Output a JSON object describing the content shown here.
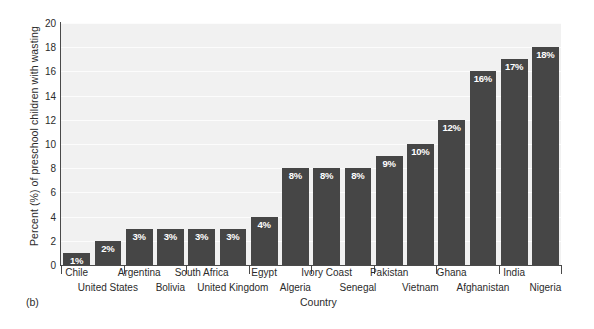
{
  "panel_label": "(b)",
  "chart_data": {
    "type": "bar",
    "title": "",
    "xlabel": "Country",
    "ylabel": "Percent (%) of preschool children with wasting",
    "categories": [
      "Chile",
      "United States",
      "Argentina",
      "Bolivia",
      "South Africa",
      "United Kingdom",
      "Egypt",
      "Algeria",
      "Ivory Coast",
      "Senegal",
      "Pakistan",
      "Vietnam",
      "Ghana",
      "Afghanistan",
      "India",
      "Nigeria"
    ],
    "values": [
      1,
      2,
      3,
      3,
      3,
      3,
      4,
      8,
      8,
      8,
      9,
      10,
      12,
      16,
      17,
      18
    ],
    "value_labels": [
      "1%",
      "2%",
      "3%",
      "3%",
      "3%",
      "3%",
      "4%",
      "8%",
      "8%",
      "8%",
      "9%",
      "10%",
      "12%",
      "16%",
      "17%",
      "18%"
    ],
    "ylim": [
      0,
      20
    ],
    "yticks": [
      0,
      2,
      4,
      6,
      8,
      10,
      12,
      14,
      16,
      18,
      20
    ],
    "ytick_labels": [
      "0",
      "2",
      "4",
      "6",
      "8",
      "10",
      "12",
      "14",
      "16",
      "18",
      "20"
    ],
    "grid": true,
    "legend": "none",
    "bar_color": "#464646",
    "plot_background": "#f1f1f1",
    "axis_color": "#4a4a4a",
    "value_label_color": "#ffffff"
  }
}
